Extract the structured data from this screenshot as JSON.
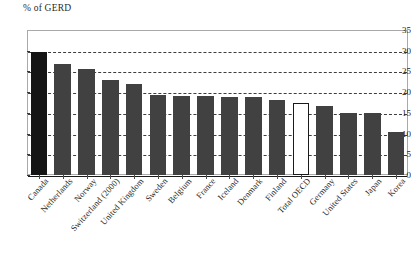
{
  "chart_data": {
    "type": "bar",
    "title": "",
    "ylabel": "% of GERD",
    "xlabel": "",
    "ylim": [
      0,
      35
    ],
    "yticks": [
      0,
      5,
      10,
      15,
      20,
      25,
      30,
      35
    ],
    "grid": true,
    "legend": "none",
    "categories": [
      "Canada",
      "Netherlands",
      "Norway",
      "Switzerland (2000)",
      "United Kingdom",
      "Sweden",
      "Belgium",
      "France",
      "Iceland",
      "Denmark",
      "Finland",
      "Total OECD",
      "Germany",
      "United States",
      "Japan",
      "Korea"
    ],
    "values": [
      29.8,
      26.8,
      25.7,
      23.0,
      22.0,
      19.3,
      19.1,
      19.0,
      18.9,
      18.8,
      18.1,
      17.5,
      16.6,
      15.0,
      15.0,
      10.5
    ],
    "bar_styles": [
      "highlight",
      "filled",
      "filled",
      "filled",
      "filled",
      "filled",
      "filled",
      "filled",
      "filled",
      "filled",
      "filled",
      "outline",
      "filled",
      "filled",
      "filled",
      "filled"
    ]
  },
  "colors": {
    "bar_fill": "#414141",
    "bar_highlight": "#151515",
    "bar_outline_fill": "#ffffff",
    "gridline": "#333333",
    "frame": "#a9a9a9",
    "text": "#242424"
  }
}
